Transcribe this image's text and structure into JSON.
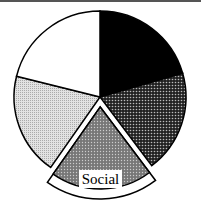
{
  "chart_data": {
    "type": "pie",
    "title": "",
    "highlighted": "Social",
    "slices": [
      {
        "name": "",
        "start_deg": 0,
        "end_deg": 74,
        "fill": "black",
        "value": 20.5
      },
      {
        "name": "",
        "start_deg": 74,
        "end_deg": 143,
        "fill": "dark-dot",
        "value": 19.2
      },
      {
        "name": "Social",
        "start_deg": 143,
        "end_deg": 215,
        "fill": "mid-dot",
        "value": 20.0,
        "exploded": true
      },
      {
        "name": "",
        "start_deg": 215,
        "end_deg": 284,
        "fill": "light-dot",
        "value": 19.2
      },
      {
        "name": "",
        "start_deg": 284,
        "end_deg": 360,
        "fill": "white",
        "value": 21.1
      }
    ],
    "legend": "none"
  },
  "labels": {
    "social": "Social"
  }
}
